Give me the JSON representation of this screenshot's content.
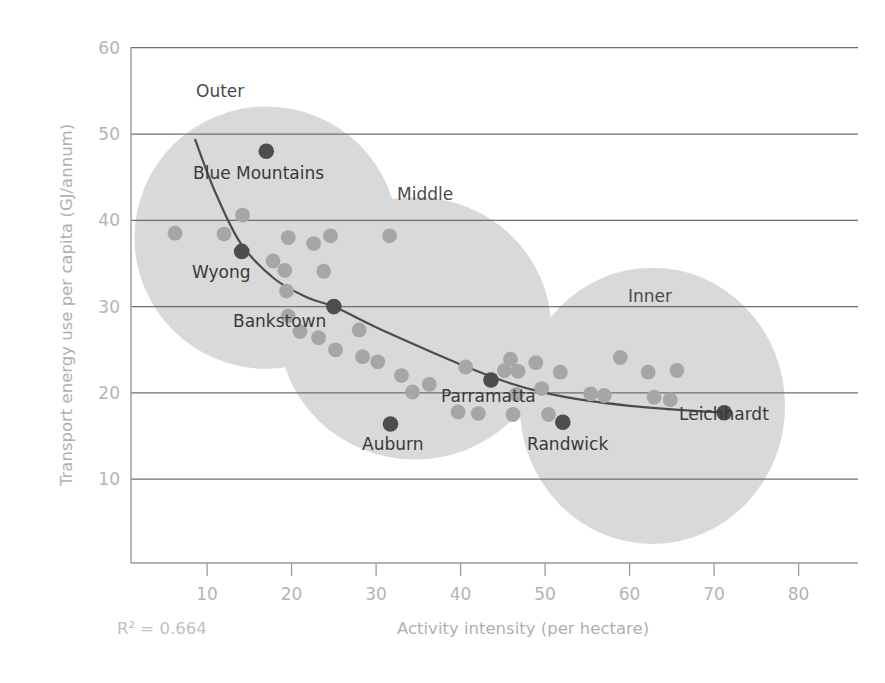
{
  "chart_data": {
    "type": "scatter",
    "title": "",
    "xlabel": "Activity intensity (per hectare)",
    "ylabel": "Transport energy use per capita (GJ/annum)",
    "xlim": [
      0,
      85
    ],
    "ylim": [
      0,
      62
    ],
    "xticks": [
      10,
      20,
      30,
      40,
      50,
      60,
      70,
      80
    ],
    "yticks": [
      10,
      20,
      30,
      40,
      50,
      60
    ],
    "grid": "horizontal",
    "legend": "none",
    "annotation_r2": "R² = 0.664",
    "r2_value": 0.664,
    "clusters": [
      {
        "name": "Outer",
        "label": "Outer",
        "cx": 17.0,
        "cy": 38.0,
        "rx": 15.6,
        "ry": 15.2
      },
      {
        "name": "Middle",
        "label": "Middle",
        "cx": 34.6,
        "cy": 27.5,
        "rx": 16.1,
        "ry": 15.2
      },
      {
        "name": "Inner",
        "label": "Inner",
        "cx": 62.7,
        "cy": 18.5,
        "rx": 15.7,
        "ry": 16.0
      }
    ],
    "highlighted_points": [
      {
        "label": "Blue Mountains",
        "x": 17.0,
        "y": 48.0
      },
      {
        "label": "Wyong",
        "x": 14.1,
        "y": 36.4
      },
      {
        "label": "Bankstown",
        "x": 25.0,
        "y": 30.0
      },
      {
        "label": "Auburn",
        "x": 31.7,
        "y": 16.4
      },
      {
        "label": "Parramatta",
        "x": 43.6,
        "y": 21.5
      },
      {
        "label": "Randwick",
        "x": 52.1,
        "y": 16.6
      },
      {
        "label": "Leichhardt",
        "x": 71.2,
        "y": 17.7
      }
    ],
    "points": [
      {
        "x": 6.2,
        "y": 38.5
      },
      {
        "x": 12.0,
        "y": 38.4
      },
      {
        "x": 14.2,
        "y": 40.6
      },
      {
        "x": 19.6,
        "y": 38.0
      },
      {
        "x": 17.8,
        "y": 35.3
      },
      {
        "x": 19.2,
        "y": 34.2
      },
      {
        "x": 19.4,
        "y": 31.8
      },
      {
        "x": 19.6,
        "y": 28.9
      },
      {
        "x": 22.6,
        "y": 37.3
      },
      {
        "x": 24.6,
        "y": 38.2
      },
      {
        "x": 23.8,
        "y": 34.1
      },
      {
        "x": 21.0,
        "y": 27.1
      },
      {
        "x": 23.2,
        "y": 26.4
      },
      {
        "x": 25.2,
        "y": 25.0
      },
      {
        "x": 31.6,
        "y": 38.2
      },
      {
        "x": 28.0,
        "y": 27.3
      },
      {
        "x": 28.4,
        "y": 24.2
      },
      {
        "x": 30.2,
        "y": 23.6
      },
      {
        "x": 33.0,
        "y": 22.0
      },
      {
        "x": 34.3,
        "y": 20.1
      },
      {
        "x": 36.3,
        "y": 21.0
      },
      {
        "x": 39.7,
        "y": 17.8
      },
      {
        "x": 42.1,
        "y": 17.6
      },
      {
        "x": 40.6,
        "y": 23.0
      },
      {
        "x": 45.2,
        "y": 22.6
      },
      {
        "x": 45.9,
        "y": 23.9
      },
      {
        "x": 46.8,
        "y": 22.5
      },
      {
        "x": 46.6,
        "y": 19.8
      },
      {
        "x": 46.2,
        "y": 17.5
      },
      {
        "x": 48.9,
        "y": 23.5
      },
      {
        "x": 49.6,
        "y": 20.5
      },
      {
        "x": 50.4,
        "y": 17.5
      },
      {
        "x": 51.8,
        "y": 22.4
      },
      {
        "x": 55.4,
        "y": 19.9
      },
      {
        "x": 57.0,
        "y": 19.7
      },
      {
        "x": 58.9,
        "y": 24.1
      },
      {
        "x": 62.2,
        "y": 22.4
      },
      {
        "x": 62.9,
        "y": 19.5
      },
      {
        "x": 65.6,
        "y": 22.6
      },
      {
        "x": 64.8,
        "y": 19.2
      }
    ],
    "trend_line": {
      "description": "fitted decay curve",
      "points": [
        {
          "x": 8.6,
          "y": 49.3
        },
        {
          "x": 11.0,
          "y": 43.2
        },
        {
          "x": 14.0,
          "y": 37.3
        },
        {
          "x": 18.0,
          "y": 33.2
        },
        {
          "x": 22.0,
          "y": 31.0
        },
        {
          "x": 25.0,
          "y": 30.0
        },
        {
          "x": 30.0,
          "y": 27.6
        },
        {
          "x": 35.0,
          "y": 25.4
        },
        {
          "x": 40.0,
          "y": 23.3
        },
        {
          "x": 45.0,
          "y": 21.4
        },
        {
          "x": 50.0,
          "y": 20.0
        },
        {
          "x": 55.0,
          "y": 19.1
        },
        {
          "x": 60.0,
          "y": 18.5
        },
        {
          "x": 65.0,
          "y": 18.1
        },
        {
          "x": 71.2,
          "y": 17.7
        }
      ]
    },
    "colors": {
      "cluster_fill": "#d9d9d9",
      "point": "#a6a6a6",
      "highlight_point": "#4d4d4d",
      "trend_line": "#4d4d4d",
      "gridline": "#6e6e6e",
      "axis": "#9a9a9a",
      "tick_text": "#b4b4b4",
      "axis_title": "#b0b0b0",
      "label_text": "#3a3a3a",
      "background": "#ffffff"
    }
  },
  "axes": {
    "x": {
      "title": "Activity intensity (per hectare)",
      "ticks": [
        "10",
        "20",
        "30",
        "40",
        "50",
        "60",
        "70",
        "80"
      ]
    },
    "y": {
      "title": "Transport energy use per capita (GJ/annum)",
      "ticks": [
        "60",
        "50",
        "40",
        "30",
        "20",
        "10"
      ]
    }
  },
  "annotations": {
    "r2": "R² = 0.664"
  },
  "cluster_labels": {
    "outer": "Outer",
    "middle": "Middle",
    "inner": "Inner"
  },
  "point_labels": {
    "blue_mountains": "Blue Mountains",
    "wyong": "Wyong",
    "bankstown": "Bankstown",
    "auburn": "Auburn",
    "parramatta": "Parramatta",
    "randwick": "Randwick",
    "leichhardt": "Leichhardt"
  }
}
